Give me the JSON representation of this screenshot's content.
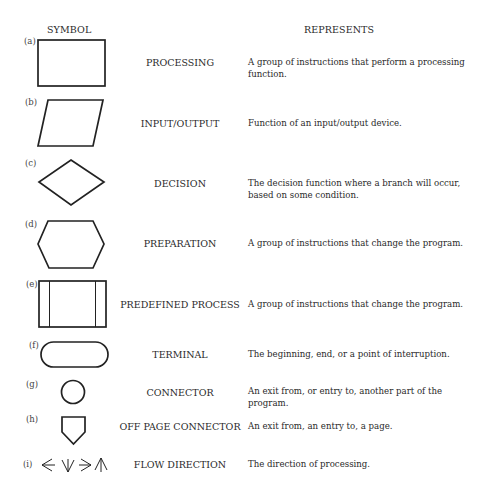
{
  "headers": {
    "symbol": "SYMBOL",
    "represents": "REPRESENTS"
  },
  "rows": [
    {
      "letter": "(a)",
      "shape": "rectangle-icon",
      "name": "PROCESSING",
      "description": "A group of instructions that perform a processing function."
    },
    {
      "letter": "(b)",
      "shape": "parallelogram-icon",
      "name": "INPUT/OUTPUT",
      "description": "Function of an input/output device."
    },
    {
      "letter": "(c)",
      "shape": "diamond-icon",
      "name": "DECISION",
      "description": "The decision function where a branch will occur, based on some condition."
    },
    {
      "letter": "(d)",
      "shape": "hexagon-icon",
      "name": "PREPARATION",
      "description": "A group of instructions that change the program."
    },
    {
      "letter": "(e)",
      "shape": "predefined-process-icon",
      "name": "PREDEFINED PROCESS",
      "description": "A group of instructions that change the program."
    },
    {
      "letter": "(f)",
      "shape": "terminal-icon",
      "name": "TERMINAL",
      "description": "The beginning, end, or a point of interruption."
    },
    {
      "letter": "(g)",
      "shape": "circle-connector-icon",
      "name": "CONNECTOR",
      "description": "An exit from, or entry to, another part of the program."
    },
    {
      "letter": "(h)",
      "shape": "off-page-connector-icon",
      "name": "OFF PAGE CONNECTOR",
      "description": "An exit from, an entry to, a page."
    },
    {
      "letter": "(i)",
      "shape": "flow-arrows-icon",
      "name": "FLOW DIRECTION",
      "description": "The direction of processing."
    }
  ],
  "colors": {
    "ink": "#222222",
    "background": "#ffffff"
  }
}
